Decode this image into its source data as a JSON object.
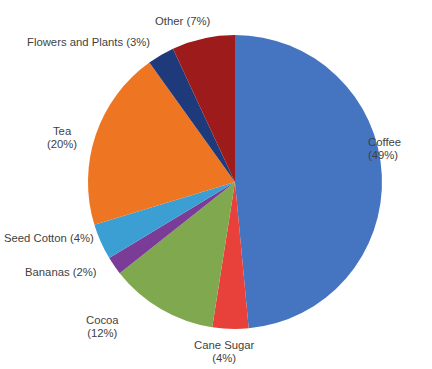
{
  "chart_data": {
    "type": "pie",
    "title": "",
    "categories": [
      "Coffee",
      "Cane Sugar",
      "Cocoa",
      "Bananas",
      "Seed Cotton",
      "Tea",
      "Flowers and Plants",
      "Other"
    ],
    "values": [
      49,
      4,
      12,
      2,
      4,
      20,
      3,
      7
    ],
    "unit": "%",
    "start_angle_deg": 0,
    "direction": "clockwise",
    "legend": "none",
    "labels_mode": "callout-outside",
    "slices": [
      {
        "name": "Coffee",
        "value": 49,
        "color": "#4575c0",
        "label_line1": "Coffee",
        "label_line2": "(49%)",
        "label_x": 368,
        "label_y": 136,
        "align": "right"
      },
      {
        "name": "Cane Sugar",
        "value": 4,
        "color": "#e8403a",
        "label_line1": "Cane Sugar",
        "label_line2": "(4%)",
        "label_x": 194,
        "label_y": 339,
        "align": "center"
      },
      {
        "name": "Cocoa",
        "value": 12,
        "color": "#80a84f",
        "label_line1": "Cocoa",
        "label_line2": "(12%)",
        "label_x": 86,
        "label_y": 314,
        "align": "center"
      },
      {
        "name": "Bananas",
        "value": 2,
        "color": "#7a3c96",
        "label_line1": "Bananas (2%)",
        "label_line2": "",
        "label_x": 25,
        "label_y": 266,
        "align": "left"
      },
      {
        "name": "Seed Cotton",
        "value": 4,
        "color": "#3c9fd4",
        "label_line1": "Seed Cotton (4%)",
        "label_line2": "",
        "label_x": 4,
        "label_y": 232,
        "align": "left"
      },
      {
        "name": "Tea",
        "value": 20,
        "color": "#ee7622",
        "label_line1": "Tea",
        "label_line2": "(20%)",
        "label_x": 47,
        "label_y": 125,
        "align": "center"
      },
      {
        "name": "Flowers and Plants",
        "value": 3,
        "color": "#1f3a7a",
        "label_line1": "Flowers and Plants (3%)",
        "label_line2": "",
        "label_x": 27,
        "label_y": 36,
        "align": "left"
      },
      {
        "name": "Other",
        "value": 7,
        "color": "#9e1b1b",
        "label_line1": "Other (7%)",
        "label_line2": "",
        "label_x": 155,
        "label_y": 15,
        "align": "left"
      }
    ],
    "geometry": {
      "cx": 235,
      "cy": 182,
      "r": 147
    }
  }
}
